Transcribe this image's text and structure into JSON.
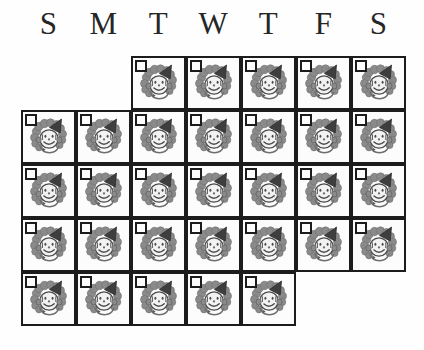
{
  "calendar": {
    "weekday_headers": [
      {
        "label": "S",
        "name": "sunday"
      },
      {
        "label": "M",
        "name": "monday"
      },
      {
        "label": "T",
        "name": "tuesday"
      },
      {
        "label": "W",
        "name": "wednesday"
      },
      {
        "label": "T",
        "name": "thursday"
      },
      {
        "label": "F",
        "name": "friday"
      },
      {
        "label": "S",
        "name": "saturday"
      }
    ],
    "columns": 7,
    "rows": 5,
    "cell_icon": "clown-face-icon",
    "cell_checkbox": "empty-checkbox",
    "cells": [
      {
        "row": 0,
        "col": 2
      },
      {
        "row": 0,
        "col": 3
      },
      {
        "row": 0,
        "col": 4
      },
      {
        "row": 0,
        "col": 5
      },
      {
        "row": 0,
        "col": 6
      },
      {
        "row": 1,
        "col": 0
      },
      {
        "row": 1,
        "col": 1
      },
      {
        "row": 1,
        "col": 2
      },
      {
        "row": 1,
        "col": 3
      },
      {
        "row": 1,
        "col": 4
      },
      {
        "row": 1,
        "col": 5
      },
      {
        "row": 1,
        "col": 6
      },
      {
        "row": 2,
        "col": 0
      },
      {
        "row": 2,
        "col": 1
      },
      {
        "row": 2,
        "col": 2
      },
      {
        "row": 2,
        "col": 3
      },
      {
        "row": 2,
        "col": 4
      },
      {
        "row": 2,
        "col": 5
      },
      {
        "row": 2,
        "col": 6
      },
      {
        "row": 3,
        "col": 0
      },
      {
        "row": 3,
        "col": 1
      },
      {
        "row": 3,
        "col": 2
      },
      {
        "row": 3,
        "col": 3
      },
      {
        "row": 3,
        "col": 4
      },
      {
        "row": 3,
        "col": 5
      },
      {
        "row": 3,
        "col": 6
      },
      {
        "row": 4,
        "col": 0
      },
      {
        "row": 4,
        "col": 1
      },
      {
        "row": 4,
        "col": 2
      },
      {
        "row": 4,
        "col": 3
      },
      {
        "row": 4,
        "col": 4
      }
    ]
  },
  "colors": {
    "background": "#fefefe",
    "cell_background": "#fcfcfc",
    "border": "#1c1c1c",
    "header_text": "#262626",
    "clown_hat": "#3e3e3e",
    "clown_hair": "#8a8a8a",
    "clown_face": "#f2f2f2",
    "clown_outline": "#4a4a4a",
    "clown_detail": "#6e6e6e"
  },
  "metrics": {
    "cell_width": 55,
    "cell_height": 54,
    "grid_left": 21,
    "grid_top": 56
  }
}
